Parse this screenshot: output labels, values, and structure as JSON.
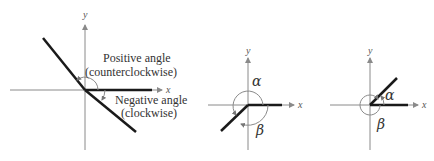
{
  "diagrams": [
    {
      "id": "general",
      "x_label": "x",
      "y_label": "y",
      "positive_label": "Positive angle",
      "positive_sub": "(counterclockwise)",
      "negative_label": "Negative angle",
      "negative_sub": "(clockwise)"
    },
    {
      "id": "coterminal-1",
      "x_label": "x",
      "y_label": "y",
      "alpha": "α",
      "beta": "β"
    },
    {
      "id": "coterminal-2",
      "x_label": "x",
      "y_label": "y",
      "alpha": "α",
      "beta": "β"
    }
  ],
  "colors": {
    "axis": "#8a8a8a",
    "terminal_side": "#1a1a1a",
    "text": "#333333"
  }
}
